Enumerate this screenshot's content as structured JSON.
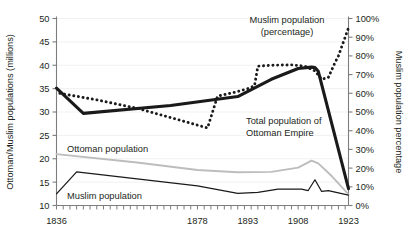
{
  "chart_data": {
    "type": "line",
    "title": "",
    "xlabel": "",
    "ylabel": "Ottoman/Muslim populations (millions)",
    "y2label": "Muslim population percentage",
    "xlim": [
      1836,
      1923
    ],
    "ylim": [
      10,
      50
    ],
    "y2lim": [
      0,
      100
    ],
    "grid": false,
    "legend": "inline-annotations",
    "x_ticks": [
      1836,
      1878,
      1893,
      1908,
      1923
    ],
    "x_tick_labels": [
      "1836",
      "1878",
      "1893",
      "1908",
      "1923"
    ],
    "y_ticks": [
      10,
      15,
      20,
      25,
      30,
      35,
      40,
      45,
      50
    ],
    "y_tick_labels": [
      "10",
      "15",
      "20",
      "25",
      "30",
      "35",
      "40",
      "45",
      "50"
    ],
    "y2_ticks": [
      0,
      10,
      20,
      30,
      40,
      50,
      60,
      70,
      80,
      90,
      100
    ],
    "y2_tick_labels": [
      "0%",
      "10%",
      "20%",
      "30%",
      "40%",
      "50%",
      "60%",
      "70%",
      "80%",
      "90%",
      "100%"
    ],
    "minor_tick_interval": 2,
    "series": [
      {
        "name": "Total population of Ottoman Empire",
        "axis": "left",
        "style": "thick-solid",
        "color": "#1a1a1a",
        "label_text": "Total population of\nOttoman Empire",
        "points": [
          [
            1836,
            35.1
          ],
          [
            1844,
            29.7
          ],
          [
            1870,
            31.4
          ],
          [
            1890,
            33.3
          ],
          [
            1900,
            37.0
          ],
          [
            1908,
            39.3
          ],
          [
            1912,
            39.6
          ],
          [
            1913,
            39.5
          ],
          [
            1914,
            38.7
          ],
          [
            1923,
            13.6
          ]
        ]
      },
      {
        "name": "Muslim population (percentage)",
        "axis": "right",
        "style": "dotted",
        "color": "#1a1a1a",
        "label_text": "Muslim population\n(percentage)",
        "points": [
          [
            1837,
            60.0
          ],
          [
            1848,
            56.5
          ],
          [
            1860,
            52.0
          ],
          [
            1872,
            46.0
          ],
          [
            1881,
            41.5
          ],
          [
            1884,
            58.5
          ],
          [
            1889,
            60.5
          ],
          [
            1893,
            62.5
          ],
          [
            1895,
            64.0
          ],
          [
            1896,
            74.5
          ],
          [
            1900,
            75.0
          ],
          [
            1906,
            75.2
          ],
          [
            1910,
            74.5
          ],
          [
            1913,
            72.0
          ],
          [
            1915,
            67.5
          ],
          [
            1917,
            68.5
          ],
          [
            1919,
            76.5
          ],
          [
            1920,
            80.0
          ],
          [
            1921,
            85.0
          ],
          [
            1922,
            90.0
          ],
          [
            1923,
            95.0
          ]
        ]
      },
      {
        "name": "Ottoman population",
        "axis": "left",
        "style": "thin-gray",
        "color": "#bdbdbd",
        "label_text": "Ottoman population",
        "points": [
          [
            1836,
            21.0
          ],
          [
            1860,
            19.2
          ],
          [
            1878,
            17.6
          ],
          [
            1890,
            17.1
          ],
          [
            1900,
            17.2
          ],
          [
            1908,
            18.1
          ],
          [
            1912,
            19.6
          ],
          [
            1914,
            19.0
          ],
          [
            1918,
            16.3
          ],
          [
            1923,
            12.4
          ]
        ]
      },
      {
        "name": "Muslim population",
        "axis": "left",
        "style": "thin-black",
        "color": "#1a1a1a",
        "label_text": "Muslim population",
        "points": [
          [
            1836,
            12.5
          ],
          [
            1842,
            17.2
          ],
          [
            1878,
            14.2
          ],
          [
            1890,
            12.6
          ],
          [
            1896,
            12.8
          ],
          [
            1902,
            13.5
          ],
          [
            1909,
            13.5
          ],
          [
            1911,
            13.2
          ],
          [
            1913,
            15.5
          ],
          [
            1915,
            13.0
          ],
          [
            1917,
            13.2
          ],
          [
            1923,
            12.2
          ]
        ]
      }
    ],
    "annotations": [
      {
        "name": "muslim-percentage-label",
        "line1": "Muslim population",
        "line2": "(percentage)"
      },
      {
        "name": "total-population-label",
        "line1": "Total population of",
        "line2": "Ottoman Empire"
      },
      {
        "name": "ottoman-population-label",
        "line1": "Ottoman population",
        "line2": ""
      },
      {
        "name": "muslim-population-label",
        "line1": "Muslim population",
        "line2": ""
      }
    ]
  }
}
